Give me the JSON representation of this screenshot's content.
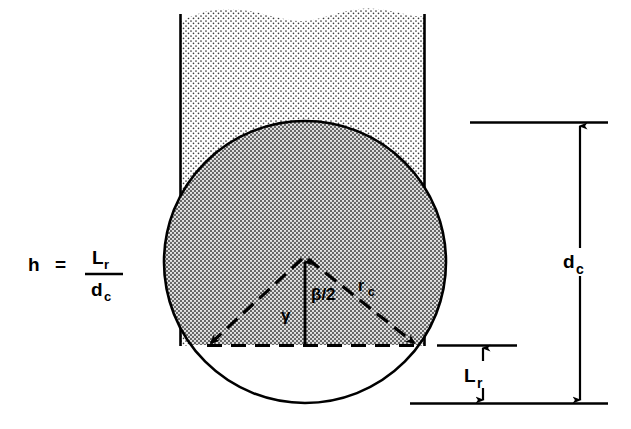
{
  "figure": {
    "background_color": "#ffffff",
    "ink_color": "#000000",
    "stipple_color": "#2b2b2b"
  },
  "equation": {
    "lhs": "h",
    "equals": "=",
    "numerator": "L",
    "numerator_sub": "r",
    "denominator": "d",
    "denominator_sub": "c",
    "full_text": "h = L_r / d_c"
  },
  "geometry": {
    "column": {
      "name": "stippled-column",
      "left_wall_x": 180,
      "right_wall_x": 425,
      "top_y": 8,
      "fill": "light-stipple"
    },
    "circle": {
      "name": "circle-cross-section",
      "center_x": 305,
      "center_y": 262,
      "radius": 141,
      "top_y": 122,
      "bottom_y": 403,
      "left_x": 195,
      "right_x": 423,
      "fill_above_chord": "dark-stipple",
      "fill_below_chord": "white"
    },
    "chord": {
      "name": "chord-line",
      "y": 345,
      "x_start": 207,
      "x_end": 420,
      "style": "dashed"
    },
    "radii": [
      {
        "name": "left-radius",
        "from": [
          305,
          260
        ],
        "to": [
          207,
          345
        ],
        "style": "dashed",
        "arrow": "to"
      },
      {
        "name": "right-radius",
        "from": [
          305,
          260
        ],
        "to": [
          418,
          345
        ],
        "style": "dashed",
        "arrow": "to",
        "label": "r_c"
      }
    ],
    "center_line": {
      "name": "apothem-line",
      "from": [
        305,
        345
      ],
      "to": [
        305,
        258
      ],
      "arrow": "up"
    }
  },
  "labels": {
    "beta_half": "β/2",
    "gamma": "γ",
    "radius": "r",
    "radius_sub": "c",
    "diameter": "d",
    "diameter_sub": "c",
    "liquid_depth": "L",
    "liquid_depth_sub": "r"
  },
  "dimensions": [
    {
      "name": "dc-dimension",
      "label": "d_c",
      "measures": "circle diameter",
      "top_y": 122,
      "bottom_y": 403,
      "line_x": 580,
      "ext_top_x_start": 470,
      "ext_top_x_end": 608,
      "ext_bottom_x_start": 410,
      "ext_bottom_x_end": 608,
      "arrows": "both"
    },
    {
      "name": "lr-dimension",
      "label": "L_r",
      "measures": "segment height below chord",
      "top_y": 345,
      "bottom_y": 403,
      "line_x": 483,
      "ext_top_x_start": 437,
      "ext_top_x_end": 517,
      "arrows": "both"
    }
  ]
}
